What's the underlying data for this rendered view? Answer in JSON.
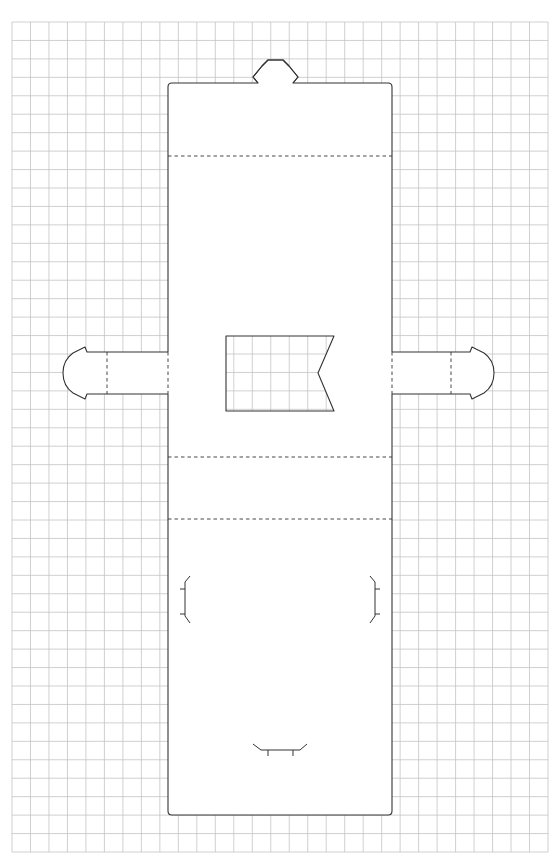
{
  "template": {
    "name": "box-cutout-template",
    "background_color": "#ffffff",
    "grid_color": "#c4c4c4",
    "line_color": "#333333",
    "grid": {
      "columns": 29,
      "rows": 45
    },
    "parts": [
      {
        "id": "main-panel",
        "kind": "cut",
        "label": "main body panel"
      },
      {
        "id": "top-tab",
        "kind": "cut",
        "label": "top closure tab"
      },
      {
        "id": "left-tab",
        "kind": "cut",
        "label": "left side tab"
      },
      {
        "id": "right-tab",
        "kind": "cut",
        "label": "right side tab"
      },
      {
        "id": "window-cutout",
        "kind": "cut",
        "label": "flag-shaped window"
      },
      {
        "id": "fold-line-1",
        "kind": "fold",
        "label": "upper fold"
      },
      {
        "id": "fold-line-2",
        "kind": "fold",
        "label": "middle fold"
      },
      {
        "id": "fold-line-3",
        "kind": "fold",
        "label": "lower fold"
      },
      {
        "id": "left-tab-fold",
        "kind": "fold",
        "label": "left tab fold"
      },
      {
        "id": "right-tab-fold",
        "kind": "fold",
        "label": "right tab fold"
      },
      {
        "id": "left-slot",
        "kind": "slit",
        "label": "left insert slot"
      },
      {
        "id": "right-slot",
        "kind": "slit",
        "label": "right insert slot"
      },
      {
        "id": "bottom-slot",
        "kind": "slit",
        "label": "bottom insert slot"
      }
    ]
  }
}
